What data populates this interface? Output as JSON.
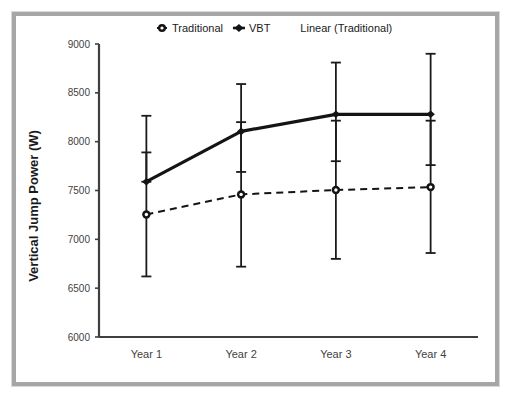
{
  "chart_data": {
    "type": "line",
    "title": "",
    "xlabel": "",
    "ylabel": "Vertical Jump Power (W)",
    "categories": [
      "Year 1",
      "Year 2",
      "Year 3",
      "Year 4"
    ],
    "ylim": [
      6000,
      9000
    ],
    "yticks": [
      6000,
      6500,
      7000,
      7500,
      8000,
      8500,
      9000
    ],
    "ytick_labels": [
      "6000",
      "6500",
      "7000",
      "7500",
      "8000",
      "8500",
      "9000"
    ],
    "grid": false,
    "legend_position": "top",
    "series": [
      {
        "name": "Traditional",
        "marker": "circle-outline",
        "line_style": "none",
        "values": [
          7255,
          7460,
          7505,
          7535
        ],
        "error_low": [
          6620,
          6720,
          6800,
          6860
        ],
        "error_high": [
          7890,
          8200,
          8215,
          8215
        ]
      },
      {
        "name": "VBT",
        "marker": "diamond-filled",
        "line_style": "solid",
        "values": [
          7590,
          8105,
          8280,
          8280
        ],
        "error_low": [
          7590,
          7690,
          7800,
          7760
        ],
        "error_high": [
          8265,
          8590,
          8810,
          8900
        ]
      },
      {
        "name": "Linear (Traditional)",
        "marker": "none",
        "line_style": "dashed",
        "values": [
          7255,
          7460,
          7505,
          7535
        ]
      }
    ],
    "legend_entries": [
      {
        "label": "Traditional",
        "marker": "circle-outline"
      },
      {
        "label": "VBT",
        "marker": "diamond-filled"
      },
      {
        "label": "Linear (Traditional)",
        "marker": "none"
      }
    ],
    "colors": {
      "series": "#141414",
      "axis": "#3f3f3f",
      "frame": "#a6a6a6",
      "background": "#ffffff"
    }
  }
}
